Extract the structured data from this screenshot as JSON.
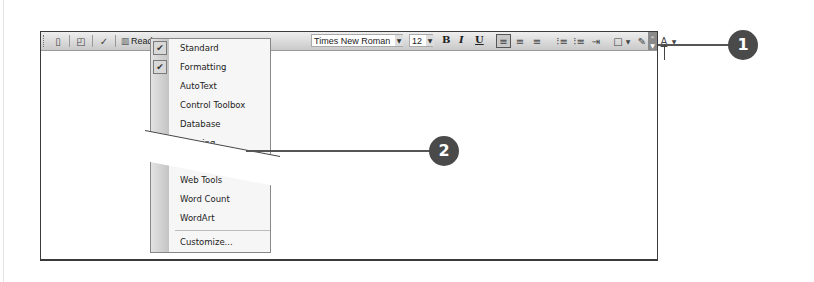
{
  "toolbar": {
    "read_label": "Read",
    "font_name": "Times New Roman",
    "font_size": "12",
    "bold": "B",
    "italic": "I",
    "underline": "U",
    "icons": [
      "new-document-icon",
      "print-preview-icon",
      "spelling-icon",
      "read-icon",
      "align-left-icon",
      "center-icon",
      "align-right-icon",
      "numbering-icon",
      "bullets-icon",
      "indent-icon",
      "border-icon",
      "highlight-icon",
      "font-color-icon",
      "toolbar-options-icon"
    ]
  },
  "menu": {
    "items": [
      {
        "label": "Standard",
        "checked": true
      },
      {
        "label": "Formatting",
        "checked": true
      },
      {
        "label": "AutoText",
        "checked": false
      },
      {
        "label": "Control Toolbox",
        "checked": false
      },
      {
        "label": "Database",
        "checked": false
      },
      {
        "label": "Drawing",
        "checked": false
      },
      {
        "label": "Web Tools",
        "checked": false
      },
      {
        "label": "Word Count",
        "checked": false
      },
      {
        "label": "WordArt",
        "checked": false
      }
    ],
    "customize_label": "Customize...",
    "check_glyph": "✔"
  },
  "callouts": {
    "one": "1",
    "two": "2"
  },
  "colors": {
    "callout_fill": "#4a4a4a",
    "toolbar_bg": "#d8d8d8"
  }
}
